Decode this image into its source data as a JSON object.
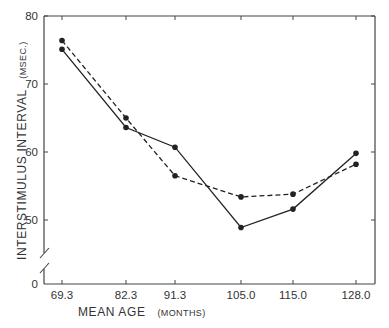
{
  "chart_data": {
    "type": "line",
    "title": "",
    "xlabel": "MEAN AGE",
    "xlabel_unit": "(MONTHS)",
    "ylabel": "INTERSTIMULUS INTERVAL",
    "ylabel_unit": "(MSEC.)",
    "categories": [
      "69.3",
      "82.3",
      "91.3",
      "105.0",
      "115.0",
      "128.0"
    ],
    "x": [
      69.3,
      82.3,
      91.3,
      105.0,
      115.0,
      128.0
    ],
    "series": [
      {
        "name": "solid",
        "style": "solid",
        "marker": "filled-circle",
        "values": [
          75.1,
          63.6,
          60.7,
          48.9,
          51.6,
          59.8
        ]
      },
      {
        "name": "dashed",
        "style": "dashed",
        "marker": "filled-circle",
        "values": [
          76.4,
          65.0,
          56.5,
          53.4,
          53.8,
          58.2
        ]
      }
    ],
    "yticks": [
      0,
      50,
      60,
      70,
      80
    ],
    "ytick_labels": [
      "0",
      "50",
      "60",
      "70",
      "80"
    ],
    "ylim": [
      0,
      80
    ],
    "y_axis_break": "between 0 and 50",
    "grid": false,
    "legend": "none",
    "colors": {
      "line": "#222222",
      "axis": "#444444",
      "text": "#333333"
    }
  }
}
